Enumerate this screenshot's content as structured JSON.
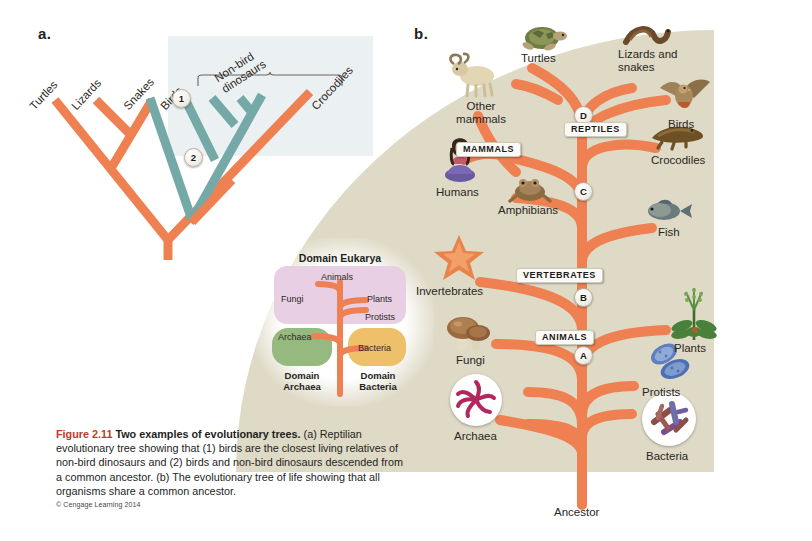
{
  "figure": {
    "panel_a_letter": "a.",
    "panel_b_letter": "b."
  },
  "colors": {
    "branch_orange": "#ee8052",
    "branch_teal": "#74a9a8",
    "beige_background": "#dedac6",
    "tint_blue": "#e8eff1",
    "eukarya_purple": "#e8cfe4",
    "archaea_green": "#96b97f",
    "bacteria_gold": "#eec06a",
    "figure_number_red": "#c0392b"
  },
  "panel_a": {
    "tips": [
      {
        "label": "Turtles"
      },
      {
        "label": "Lizards"
      },
      {
        "label": "Snakes"
      },
      {
        "label": "Birds"
      },
      {
        "label": "Crocodiles"
      }
    ],
    "bracket_label": "Non-bird dinosaurs",
    "nodes": [
      {
        "label": "1"
      },
      {
        "label": "2"
      }
    ]
  },
  "panel_b": {
    "root_label": "Ancestor",
    "tips": [
      {
        "label": "Turtles",
        "icon": "turtle-icon"
      },
      {
        "label": "Lizards and snakes",
        "icon": "snake-icon"
      },
      {
        "label": "Birds",
        "icon": "bird-icon"
      },
      {
        "label": "Crocodiles",
        "icon": "crocodile-icon"
      },
      {
        "label": "Fish",
        "icon": "fish-icon"
      },
      {
        "label": "Amphibians",
        "icon": "frog-icon"
      },
      {
        "label": "Other mammals",
        "icon": "sheep-icon"
      },
      {
        "label": "Humans",
        "icon": "human-icon"
      },
      {
        "label": "Invertebrates",
        "icon": "starfish-icon"
      },
      {
        "label": "Fungi",
        "icon": "mushroom-icon"
      },
      {
        "label": "Plants",
        "icon": "plant-icon"
      },
      {
        "label": "Protists",
        "icon": "protist-icon"
      },
      {
        "label": "Bacteria",
        "icon": "bacteria-icon"
      },
      {
        "label": "Archaea",
        "icon": "archaea-icon"
      }
    ],
    "nodes": [
      {
        "letter": "A",
        "clade": "ANIMALS"
      },
      {
        "letter": "B",
        "clade": "VERTEBRATES"
      },
      {
        "letter": "C",
        "clade": "MAMMALS"
      },
      {
        "letter": "D",
        "clade": "REPTILES"
      }
    ],
    "clade_labels": [
      {
        "text": "ANIMALS"
      },
      {
        "text": "VERTEBRATES"
      },
      {
        "text": "MAMMALS"
      },
      {
        "text": "REPTILES"
      }
    ]
  },
  "inset": {
    "title": "Domain Eukarya",
    "eukarya_members": [
      "Animals",
      "Fungi",
      "Plants",
      "Protists"
    ],
    "archaea_label": "Archaea",
    "bacteria_label": "Bacteria",
    "archaea_domain": "Domain Archaea",
    "bacteria_domain": "Domain Bacteria",
    "archaea_domain_line1": "Domain",
    "archaea_domain_line2": "Archaea",
    "bacteria_domain_line1": "Domain",
    "bacteria_domain_line2": "Bacteria"
  },
  "caption": {
    "figure_number": "Figure 2.11",
    "title": "Two examples of evolutionary trees.",
    "body": " (a) Reptilian evolutionary tree showing that (1) birds are the closest living relatives of non-bird dinosaurs and (2) birds and non-bird dinosaurs descended from a common ancestor. (b) The evolutionary tree of life showing that all organisms share a common ancestor.",
    "credit": "© Cengage Learning 2014"
  }
}
